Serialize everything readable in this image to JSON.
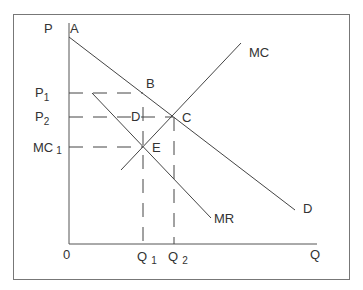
{
  "diagram": {
    "type": "monopoly-pricing-economics-diagram",
    "axes": {
      "y_label": "P",
      "x_label": "Q",
      "origin_label": "0"
    },
    "curves": {
      "demand": "D",
      "marginal_revenue": "MR",
      "marginal_cost": "MC"
    },
    "points": {
      "a": "A",
      "b": "B",
      "c": "C",
      "d": "D",
      "e": "E"
    },
    "y_ticks": {
      "p1": "P",
      "p1_sub": "1",
      "p2": "P",
      "p2_sub": "2",
      "mc1": "MC",
      "mc1_sub": "1"
    },
    "x_ticks": {
      "q1": "Q",
      "q1_sub": "1",
      "q2": "Q",
      "q2_sub": "2"
    },
    "colors": {
      "line": "#444444",
      "frame": "#777777",
      "text": "#333333"
    }
  }
}
